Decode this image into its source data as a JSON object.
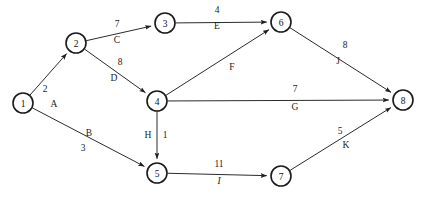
{
  "diagram": {
    "type": "directed-weighted-graph",
    "title": "",
    "width": 427,
    "height": 201,
    "background_color": "#ffffff",
    "stroke_color": "#2b2b2b",
    "node_radius": 10,
    "nodes": [
      {
        "id": "1",
        "label": "1",
        "x": 23,
        "y": 103
      },
      {
        "id": "2",
        "label": "2",
        "x": 76,
        "y": 43
      },
      {
        "id": "3",
        "label": "3",
        "x": 165,
        "y": 23
      },
      {
        "id": "4",
        "label": "4",
        "x": 157,
        "y": 101
      },
      {
        "id": "5",
        "label": "5",
        "x": 157,
        "y": 173
      },
      {
        "id": "6",
        "label": "6",
        "x": 281,
        "y": 22
      },
      {
        "id": "7",
        "label": "7",
        "x": 281,
        "y": 176
      },
      {
        "id": "8",
        "label": "8",
        "x": 403,
        "y": 100
      }
    ],
    "edges": [
      {
        "id": "A",
        "from": "1",
        "to": "2",
        "weight": "2",
        "name": "A",
        "weight_x": 45,
        "weight_y": 89,
        "name_x": 54,
        "name_y": 104,
        "name_italic": false
      },
      {
        "id": "B",
        "from": "1",
        "to": "5",
        "weight": "3",
        "name": "B",
        "weight_x": 83,
        "weight_y": 148,
        "name_x": 89,
        "name_y": 133,
        "name_italic": false
      },
      {
        "id": "C",
        "from": "2",
        "to": "3",
        "weight": "7",
        "name": "C",
        "weight_x": 117,
        "weight_y": 24,
        "name_x": 117,
        "name_y": 40,
        "name_italic": false
      },
      {
        "id": "D",
        "from": "2",
        "to": "4",
        "weight": "8",
        "name": "D",
        "weight_x": 120,
        "weight_y": 62,
        "name_x": 114,
        "name_y": 78,
        "name_italic": false
      },
      {
        "id": "E",
        "from": "3",
        "to": "6",
        "weight": "4",
        "name": "E",
        "weight_x": 217,
        "weight_y": 10,
        "name_x": 217,
        "name_y": 26,
        "name_italic": false
      },
      {
        "id": "F",
        "from": "4",
        "to": "6",
        "weight": "",
        "name": "F",
        "weight_x": 229,
        "weight_y": 52,
        "name_x": 232,
        "name_y": 67,
        "name_italic": false
      },
      {
        "id": "G",
        "from": "4",
        "to": "8",
        "weight": "7",
        "name": "G",
        "weight_x": 295,
        "weight_y": 89,
        "name_x": 295,
        "name_y": 107,
        "name_italic": false
      },
      {
        "id": "H",
        "from": "4",
        "to": "5",
        "weight": "1",
        "name": "H",
        "weight_x": 165,
        "weight_y": 135,
        "name_x": 148,
        "name_y": 135,
        "name_italic": false
      },
      {
        "id": "I",
        "from": "5",
        "to": "7",
        "weight": "11",
        "name": "I",
        "weight_x": 219,
        "weight_y": 164,
        "name_x": 219,
        "name_y": 181,
        "name_italic": true
      },
      {
        "id": "J",
        "from": "6",
        "to": "8",
        "weight": "8",
        "name": "J",
        "weight_x": 345,
        "weight_y": 45,
        "name_x": 338,
        "name_y": 61,
        "name_italic": false
      },
      {
        "id": "K",
        "from": "7",
        "to": "8",
        "weight": "5",
        "name": "K",
        "weight_x": 340,
        "weight_y": 131,
        "name_x": 346,
        "name_y": 145,
        "name_italic": false
      }
    ]
  }
}
